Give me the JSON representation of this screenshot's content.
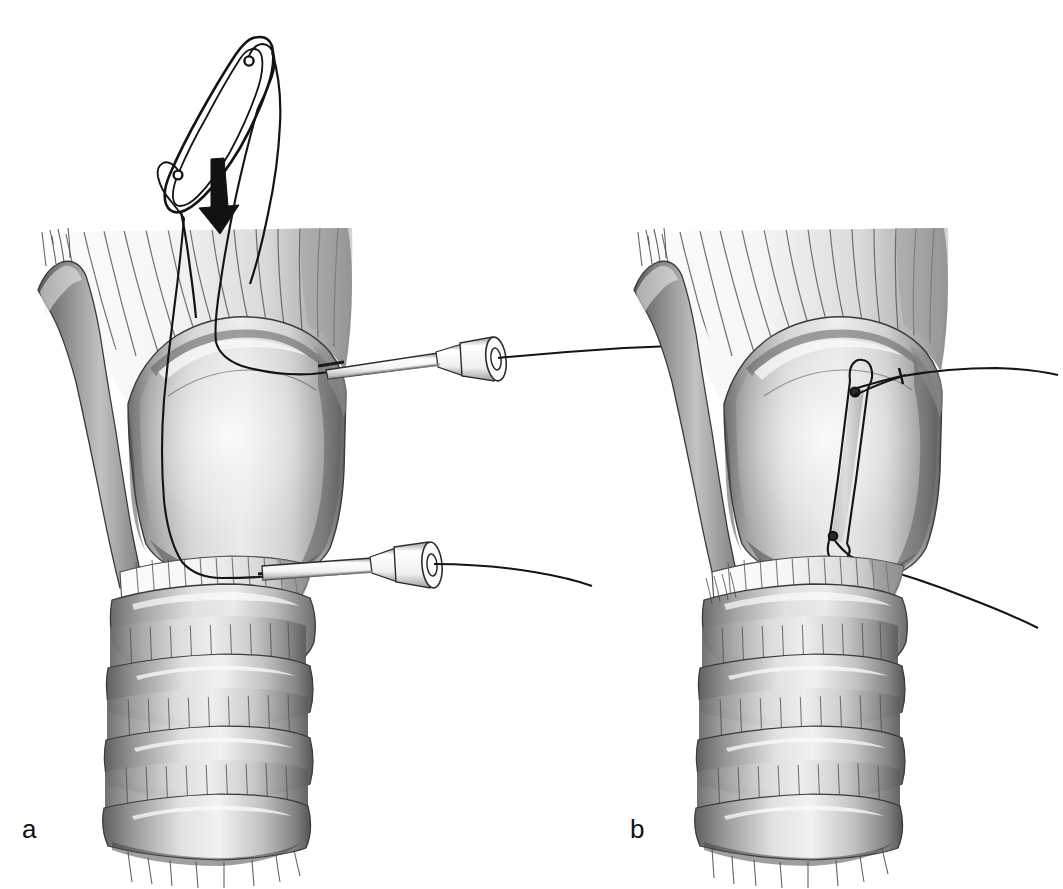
{
  "figure": {
    "kind": "medical-surgical-illustration",
    "background_color": "#ffffff",
    "ink_color": "#111111",
    "style": "grayscale airbrush medical illustration with line art",
    "panel_count": 2
  },
  "panels": [
    {
      "id": "a",
      "label": "a",
      "label_position": {
        "x": 22,
        "y": 838
      },
      "caption_text": "a",
      "description": "Epiglottis elevated and held away from the larynx; two sutures passed through the epiglottis are threaded back through hollow needles inserted through the thyrohyoid membrane and the cricothyroid membrane. The arrow indicates the direction in which the epiglottis is drawn down.",
      "elements": [
        {
          "name": "epiglottis-outline",
          "type": "line-art-cartilage"
        },
        {
          "name": "suture-hole-upper",
          "type": "perforation"
        },
        {
          "name": "suture-hole-lower",
          "type": "perforation"
        },
        {
          "name": "traction-arrow",
          "type": "arrow",
          "direction": "down"
        },
        {
          "name": "hyoid-bone",
          "type": "bone"
        },
        {
          "name": "thyrohyoid-membrane",
          "type": "membrane"
        },
        {
          "name": "thyroid-cartilage",
          "type": "cartilage"
        },
        {
          "name": "superior-cornu",
          "type": "cartilage-process"
        },
        {
          "name": "cricothyroid-membrane",
          "type": "membrane"
        },
        {
          "name": "cricoid-cartilage",
          "type": "cartilage"
        },
        {
          "name": "tracheal-rings",
          "type": "cartilage-rings",
          "count": 3
        },
        {
          "name": "needle-upper",
          "type": "hollow-needle"
        },
        {
          "name": "needle-lower",
          "type": "hollow-needle"
        },
        {
          "name": "suture-thread-anterior",
          "type": "thread"
        },
        {
          "name": "suture-thread-posterior",
          "type": "thread"
        }
      ]
    },
    {
      "id": "b",
      "label": "b",
      "label_position": {
        "x": 630,
        "y": 838
      },
      "caption_text": "b",
      "description": "The epiglottis has been drawn down against the inner surface of the thyroid cartilage; the suture ends emerge externally through the thyrohyoid and cricothyroid membranes and are ready to be tied.",
      "elements": [
        {
          "name": "hyoid-bone",
          "type": "bone"
        },
        {
          "name": "thyrohyoid-membrane",
          "type": "membrane"
        },
        {
          "name": "thyroid-cartilage",
          "type": "cartilage"
        },
        {
          "name": "superior-cornu",
          "type": "cartilage-process"
        },
        {
          "name": "epiglottis-folded",
          "type": "cartilage-line-art"
        },
        {
          "name": "suture-hole-upper",
          "type": "perforation"
        },
        {
          "name": "suture-hole-lower",
          "type": "perforation"
        },
        {
          "name": "suture-exit-upper",
          "type": "thread"
        },
        {
          "name": "suture-exit-lower",
          "type": "thread"
        },
        {
          "name": "cricothyroid-membrane",
          "type": "membrane"
        },
        {
          "name": "cricoid-cartilage",
          "type": "cartilage"
        },
        {
          "name": "tracheal-rings",
          "type": "cartilage-rings",
          "count": 3
        }
      ]
    }
  ],
  "palette": {
    "paper": "#ffffff",
    "ink": "#111111",
    "outline": "#2a2a2a",
    "cartilage_light": "#e6e6e6",
    "cartilage_mid": "#bdbdbd",
    "cartilage_dark": "#7d7d7d",
    "cartilage_shadow": "#4f4f4f",
    "membrane_light": "#f2f2f2",
    "membrane_mid": "#cfcfcf",
    "fiber_line": "#555555",
    "thread": "#141414",
    "needle_fill": "#f7f7f7"
  },
  "annotations": {
    "arrow_meaning": "direction of downward traction on the epiglottis",
    "needle_count_panel_a": 2,
    "suture_count": 2
  }
}
